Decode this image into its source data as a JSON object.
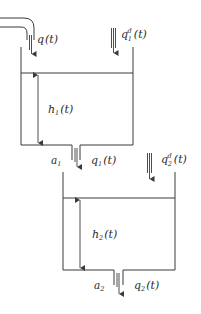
{
  "diagram": {
    "colors": {
      "line": "#3a3a3a",
      "text": "#2a2a2a",
      "background": "#ffffff"
    },
    "inflow": {
      "label": "q",
      "arg": "(t)"
    },
    "tank1": {
      "disturbance": {
        "label": "q",
        "sub": "1",
        "sup": "d",
        "arg": "(t)"
      },
      "level": {
        "label": "h",
        "sub": "1",
        "arg": "(t)"
      },
      "outlet_area": {
        "label": "a",
        "sub": "1"
      },
      "outflow": {
        "label": "q",
        "sub": "1",
        "arg": "(t)"
      }
    },
    "tank2": {
      "disturbance": {
        "label": "q",
        "sub": "2",
        "sup": "d",
        "arg": "(t)"
      },
      "level": {
        "label": "h",
        "sub": "2",
        "arg": "(t)"
      },
      "outlet_area": {
        "label": "a",
        "sub": "2"
      },
      "outflow": {
        "label": "q",
        "sub": "2",
        "arg": "(t)"
      }
    }
  }
}
